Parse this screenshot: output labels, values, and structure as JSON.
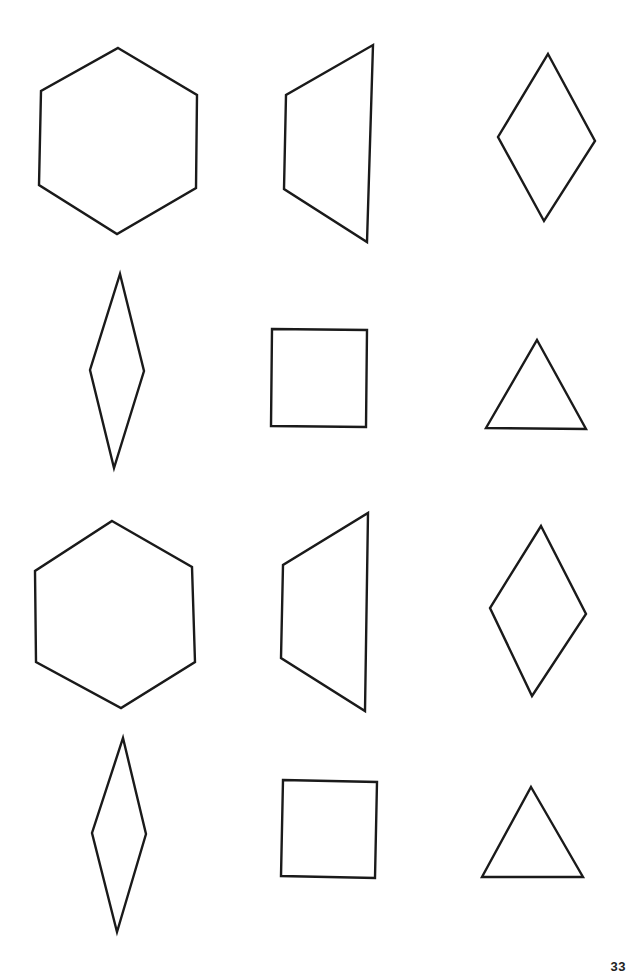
{
  "page": {
    "background": "#ffffff",
    "stroke_color": "#1a1a1a",
    "page_number": "33"
  },
  "worksheet": {
    "layout": "4 rows x 3 columns of outlined geometric shapes",
    "rows": [
      {
        "row": 1,
        "shapes": [
          {
            "type": "hexagon",
            "points": [
              [
                118,
                48
              ],
              [
                197,
                95
              ],
              [
                196,
                188
              ],
              [
                117,
                234
              ],
              [
                39,
                185
              ],
              [
                41,
                91
              ]
            ]
          },
          {
            "type": "trapezoid",
            "points": [
              [
                373,
                45
              ],
              [
                367,
                242
              ],
              [
                284,
                189
              ],
              [
                286,
                95
              ]
            ]
          },
          {
            "type": "rhombus",
            "points": [
              [
                548,
                54
              ],
              [
                595,
                141
              ],
              [
                544,
                221
              ],
              [
                498,
                137
              ]
            ]
          }
        ]
      },
      {
        "row": 2,
        "shapes": [
          {
            "type": "thin-rhombus",
            "points": [
              [
                120,
                274
              ],
              [
                144,
                371
              ],
              [
                114,
                468
              ],
              [
                90,
                370
              ]
            ]
          },
          {
            "type": "square",
            "points": [
              [
                272,
                329
              ],
              [
                367,
                330
              ],
              [
                366,
                427
              ],
              [
                271,
                426
              ]
            ]
          },
          {
            "type": "triangle",
            "points": [
              [
                537,
                340
              ],
              [
                586,
                429
              ],
              [
                486,
                428
              ]
            ]
          }
        ]
      },
      {
        "row": 3,
        "shapes": [
          {
            "type": "hexagon",
            "points": [
              [
                112,
                521
              ],
              [
                192,
                567
              ],
              [
                195,
                662
              ],
              [
                121,
                708
              ],
              [
                36,
                662
              ],
              [
                35,
                571
              ]
            ]
          },
          {
            "type": "trapezoid",
            "points": [
              [
                368,
                513
              ],
              [
                365,
                711
              ],
              [
                281,
                658
              ],
              [
                283,
                565
              ]
            ]
          },
          {
            "type": "rhombus",
            "points": [
              [
                541,
                526
              ],
              [
                586,
                614
              ],
              [
                532,
                696
              ],
              [
                490,
                608
              ]
            ]
          }
        ]
      },
      {
        "row": 4,
        "shapes": [
          {
            "type": "thin-rhombus",
            "points": [
              [
                123,
                738
              ],
              [
                146,
                834
              ],
              [
                117,
                932
              ],
              [
                92,
                833
              ]
            ]
          },
          {
            "type": "square",
            "points": [
              [
                283,
                780
              ],
              [
                377,
                782
              ],
              [
                375,
                878
              ],
              [
                281,
                876
              ]
            ]
          },
          {
            "type": "triangle",
            "points": [
              [
                531,
                787
              ],
              [
                583,
                877
              ],
              [
                482,
                877
              ]
            ]
          }
        ]
      }
    ]
  }
}
